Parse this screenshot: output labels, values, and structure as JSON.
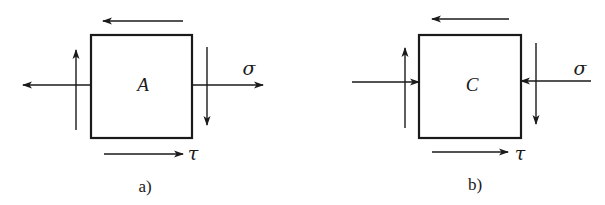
{
  "figure": {
    "panels": [
      {
        "id": "a",
        "caption": "a)",
        "element_label": "A",
        "normal_stress_label": "σ",
        "shear_stress_label": "τ",
        "normal_stress_direction": "tension (arrows point outward)",
        "shear_arrows": [
          "top: leftward",
          "bottom: rightward",
          "left: upward",
          "right: downward"
        ]
      },
      {
        "id": "b",
        "caption": "b)",
        "element_label": "C",
        "normal_stress_label": "σ",
        "shear_stress_label": "τ",
        "normal_stress_direction": "compression (arrows point inward)",
        "shear_arrows": [
          "top: leftward",
          "bottom: rightward",
          "left: upward",
          "right: downward"
        ]
      }
    ],
    "colors": {
      "line": "#1a1a1a",
      "background": "#ffffff"
    }
  }
}
